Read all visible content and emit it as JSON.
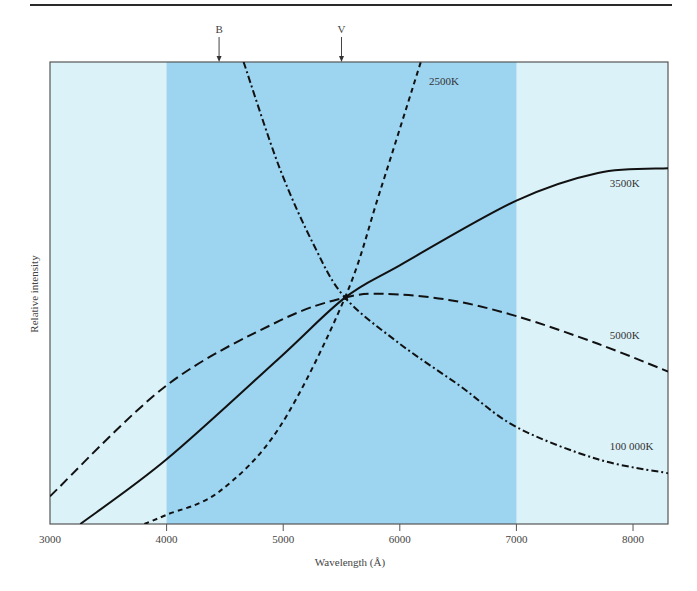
{
  "chart_data": {
    "type": "line",
    "title": "",
    "xlabel": "Wavelength (Å)",
    "ylabel": "Relative intensity",
    "xlim": [
      3000,
      8300
    ],
    "ylim": [
      0,
      1
    ],
    "xticks": [
      3000,
      4000,
      5000,
      6000,
      7000,
      8000
    ],
    "xtick_labels": [
      "3000",
      "4000",
      "5000",
      "6000",
      "7000",
      "8000"
    ],
    "yticks": [],
    "grid": false,
    "legend": "inline labels",
    "shaded_band": {
      "x_from": 4000,
      "x_to": 7000,
      "color": "#9dd4f0",
      "outside_color": "#dcf2f9"
    },
    "filter_markers": [
      {
        "label": "B",
        "wavelength": 4450
      },
      {
        "label": "V",
        "wavelength": 5500
      }
    ],
    "normalization_point": {
      "wavelength": 5500,
      "value": 0.49
    },
    "series": [
      {
        "name": "2500K",
        "style": "short-dash",
        "x": [
          3810,
          4000,
          4450,
          4970,
          5530,
          5830,
          6180
        ],
        "y": [
          0.0,
          0.02,
          0.07,
          0.21,
          0.49,
          0.72,
          1.0
        ],
        "label_pos": {
          "wavelength": 6250,
          "value": 0.95
        }
      },
      {
        "name": "3500K",
        "style": "solid",
        "x": [
          3260,
          4000,
          4970,
          5530,
          6000,
          7000,
          7700,
          8300
        ],
        "y": [
          0.0,
          0.14,
          0.36,
          0.49,
          0.56,
          0.7,
          0.76,
          0.77
        ],
        "label_pos": {
          "wavelength": 7800,
          "value": 0.73
        }
      },
      {
        "name": "5000K",
        "style": "long-dash",
        "x": [
          3000,
          4000,
          4970,
          5530,
          5870,
          6420,
          7000,
          7700,
          8300
        ],
        "y": [
          0.06,
          0.3,
          0.44,
          0.49,
          0.498,
          0.485,
          0.45,
          0.39,
          0.33
        ],
        "label_pos": {
          "wavelength": 7800,
          "value": 0.4
        }
      },
      {
        "name": "100 000K",
        "style": "dash-dot",
        "x": [
          4660,
          4970,
          5270,
          5530,
          6000,
          6510,
          7000,
          7700,
          8300
        ],
        "y": [
          1.0,
          0.77,
          0.6,
          0.49,
          0.39,
          0.3,
          0.21,
          0.14,
          0.11
        ],
        "label_pos": {
          "wavelength": 7800,
          "value": 0.16
        }
      }
    ]
  }
}
